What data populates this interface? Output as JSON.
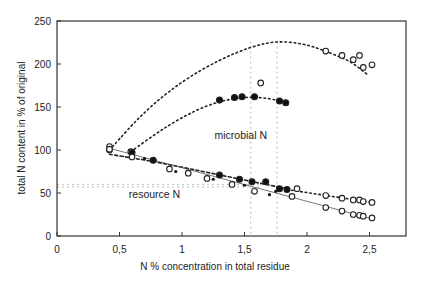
{
  "chart_data": {
    "type": "scatter",
    "title": "",
    "xlabel": "N % concentration in total residue",
    "ylabel": "total N content in % of original",
    "xlim": [
      0,
      2.75
    ],
    "ylim": [
      0,
      250
    ],
    "x_ticks": [
      0,
      0.5,
      1,
      1.5,
      2,
      2.5
    ],
    "x_tick_labels": [
      "0",
      "0,5",
      "1",
      "1,5",
      "2",
      "2,5"
    ],
    "y_ticks": [
      0,
      50,
      100,
      150,
      200,
      250
    ],
    "y_tick_labels": [
      "0",
      "50",
      "100",
      "150",
      "200",
      "250"
    ],
    "grid": false,
    "annotations": [
      {
        "text": "microbial N",
        "x": 1.47,
        "y": 113
      },
      {
        "text": "resource N",
        "x": 0.78,
        "y": 44
      }
    ],
    "reference_lines": {
      "horizontal": [
        60,
        57
      ],
      "vertical": [
        1.55,
        1.76
      ]
    },
    "series": [
      {
        "name": "total N",
        "marker": "open-circle",
        "points": [
          [
            0.42,
            104
          ],
          [
            0.42,
            100
          ],
          [
            0.59,
            98
          ],
          [
            1.63,
            178
          ],
          [
            2.15,
            215
          ],
          [
            2.28,
            210
          ],
          [
            2.37,
            205
          ],
          [
            2.42,
            210
          ],
          [
            2.45,
            196
          ],
          [
            2.52,
            199
          ]
        ],
        "fit": {
          "style": "dotted",
          "x": [
            0.42,
            0.7,
            1.0,
            1.3,
            1.55,
            1.76,
            2.0,
            2.2,
            2.35,
            2.48
          ],
          "y": [
            100,
            145,
            180,
            205,
            220,
            227,
            223,
            212,
            203,
            188
          ]
        }
      },
      {
        "name": "microbial N",
        "marker": "filled-circle",
        "points": [
          [
            1.3,
            158
          ],
          [
            1.42,
            161
          ],
          [
            1.48,
            162
          ],
          [
            1.58,
            162
          ],
          [
            1.78,
            157
          ],
          [
            1.83,
            155
          ]
        ],
        "fit": {
          "style": "dotted",
          "x": [
            0.59,
            0.8,
            1.0,
            1.2,
            1.4,
            1.6,
            1.8,
            1.85
          ],
          "y": [
            98,
            120,
            138,
            152,
            160,
            162,
            157,
            154
          ]
        }
      },
      {
        "name": "resource N (dashed)",
        "marker": "filled-circle",
        "points": [
          [
            0.6,
            97
          ],
          [
            0.77,
            88
          ],
          [
            1.3,
            71
          ],
          [
            1.46,
            66
          ],
          [
            1.56,
            63
          ],
          [
            1.67,
            63
          ],
          [
            1.78,
            55
          ],
          [
            1.84,
            54
          ]
        ],
        "fit": {
          "style": "dashed",
          "x": [
            0.42,
            0.8,
            1.3,
            1.84
          ],
          "y": [
            95,
            86,
            71,
            55
          ]
        }
      },
      {
        "name": "resource N (open, upper)",
        "marker": "open-circle",
        "points": [
          [
            1.92,
            55
          ],
          [
            2.15,
            47
          ],
          [
            2.28,
            44
          ],
          [
            2.37,
            42
          ],
          [
            2.42,
            42
          ],
          [
            2.45,
            40
          ],
          [
            2.52,
            39
          ]
        ],
        "fit": {
          "style": "dotted",
          "x": [
            1.84,
            2.52
          ],
          "y": [
            54,
            39
          ]
        }
      },
      {
        "name": "resource N (lower solid)",
        "marker": "open-circle",
        "points": [
          [
            0.42,
            101
          ],
          [
            0.6,
            92
          ],
          [
            0.9,
            78
          ],
          [
            1.05,
            73
          ],
          [
            1.2,
            67
          ],
          [
            1.4,
            60
          ],
          [
            1.58,
            52
          ],
          [
            1.88,
            46
          ],
          [
            2.15,
            33
          ],
          [
            2.28,
            29
          ],
          [
            2.37,
            25
          ],
          [
            2.42,
            24
          ],
          [
            2.45,
            23
          ],
          [
            2.52,
            21
          ]
        ],
        "small_points": [
          [
            0.7,
            90
          ],
          [
            0.95,
            75
          ],
          [
            1.25,
            66
          ],
          [
            1.5,
            59
          ],
          [
            1.75,
            52
          ],
          [
            1.7,
            48
          ]
        ],
        "fit": {
          "style": "solid",
          "x": [
            0.42,
            2.52
          ],
          "y": [
            102,
            20
          ]
        }
      }
    ]
  }
}
